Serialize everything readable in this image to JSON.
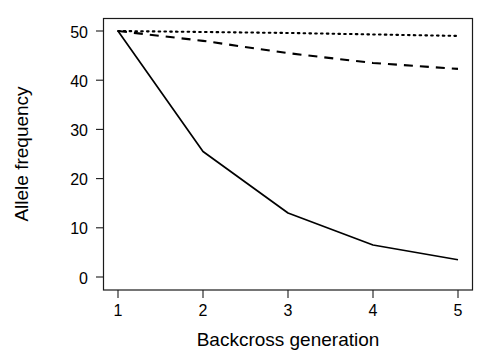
{
  "chart_data": {
    "type": "line",
    "title": "",
    "xlabel": "Backcross generation",
    "ylabel": "Allele frequency",
    "x": [
      1,
      2,
      3,
      4,
      5
    ],
    "xticklabels": [
      "1",
      "2",
      "3",
      "4",
      "5"
    ],
    "yticklabels": [
      "0",
      "10",
      "20",
      "30",
      "40",
      "50"
    ],
    "yticks": [
      0,
      10,
      20,
      30,
      40,
      50
    ],
    "xlim": [
      0.75,
      5.25
    ],
    "ylim": [
      0,
      52
    ],
    "grid": false,
    "legend": "none",
    "series": [
      {
        "name": "solid-line",
        "style": "solid",
        "color": "#000000",
        "values": [
          50.0,
          25.5,
          13.0,
          6.5,
          3.5
        ]
      },
      {
        "name": "dashed-line",
        "style": "dashed",
        "color": "#000000",
        "values": [
          50.0,
          48.0,
          45.5,
          43.5,
          42.3
        ]
      },
      {
        "name": "dotted-line",
        "style": "dotted",
        "color": "#000000",
        "values": [
          50.0,
          49.8,
          49.6,
          49.3,
          49.0
        ]
      }
    ]
  },
  "axes": {
    "x_label": "Backcross generation",
    "y_label": "Allele frequency",
    "x_ticks": [
      "1",
      "2",
      "3",
      "4",
      "5"
    ],
    "y_ticks": [
      "0",
      "10",
      "20",
      "30",
      "40",
      "50"
    ]
  }
}
